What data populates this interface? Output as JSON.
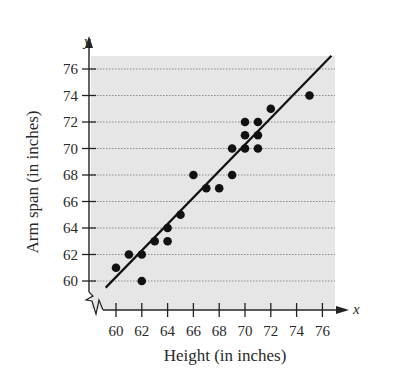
{
  "chart_data": {
    "type": "scatter",
    "title": "",
    "xlabel": "Height (in inches)",
    "ylabel": "Arm span (in inches)",
    "x_axis_var": "x",
    "y_axis_var": "y",
    "xlim": [
      59,
      77
    ],
    "ylim": [
      59,
      77
    ],
    "x_ticks": [
      60,
      62,
      64,
      66,
      68,
      70,
      72,
      74,
      76
    ],
    "y_ticks": [
      60,
      62,
      64,
      66,
      68,
      70,
      72,
      74,
      76
    ],
    "grid": "horizontal dotted",
    "axis_break": true,
    "points": [
      {
        "x": 60,
        "y": 61
      },
      {
        "x": 61,
        "y": 62
      },
      {
        "x": 62,
        "y": 62
      },
      {
        "x": 62,
        "y": 60
      },
      {
        "x": 63,
        "y": 63
      },
      {
        "x": 64,
        "y": 63
      },
      {
        "x": 64,
        "y": 64
      },
      {
        "x": 65,
        "y": 65
      },
      {
        "x": 66,
        "y": 68
      },
      {
        "x": 67,
        "y": 67
      },
      {
        "x": 68,
        "y": 67
      },
      {
        "x": 69,
        "y": 68
      },
      {
        "x": 69,
        "y": 70
      },
      {
        "x": 70,
        "y": 70
      },
      {
        "x": 70,
        "y": 71
      },
      {
        "x": 70,
        "y": 72
      },
      {
        "x": 71,
        "y": 70
      },
      {
        "x": 71,
        "y": 71
      },
      {
        "x": 71,
        "y": 72
      },
      {
        "x": 72,
        "y": 73
      },
      {
        "x": 75,
        "y": 74
      }
    ],
    "trend_line": {
      "x1": 59.2,
      "y1": 59.5,
      "x2": 76.7,
      "y2": 77.0
    }
  },
  "style": {
    "plot_background": "#e6e6e6",
    "point_color": "#111111",
    "line_color": "#111111",
    "grid_color": "#8a8a8a"
  }
}
